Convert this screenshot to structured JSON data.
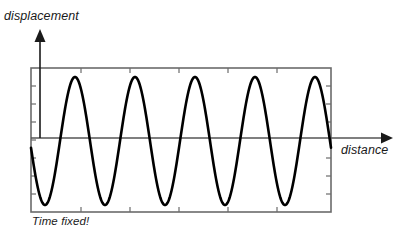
{
  "figure": {
    "title": "",
    "labels": {
      "y_axis": "displacement",
      "x_axis": "distance",
      "annotation": "Time fixed!"
    },
    "colors": {
      "curve": "#000000",
      "axis": "#555555",
      "frame": "#6b6b6b",
      "background": "#ffffff",
      "text": "#1a1a1a"
    }
  },
  "chart_data": {
    "type": "line",
    "title": "",
    "xlabel": "distance",
    "ylabel": "displacement",
    "annotations": [
      "Time fixed!"
    ],
    "grid": false,
    "legend": null,
    "waveform": {
      "function": "cosine",
      "expression": "y = -A*cos(2*pi*(x - x0)/wavelength)",
      "amplitude": 1.0,
      "wavelength": 60,
      "cycles": 5,
      "phase_description": "starts slightly below zero and descends to a trough",
      "start_value": -0.25,
      "end_value": 0.0
    },
    "axes": {
      "zero_line_y": 138,
      "plot_box": {
        "left": 31,
        "top": 68,
        "right": 331,
        "bottom": 212
      },
      "x_axis_arrow_end": 387,
      "y_axis_arrow_top": 30,
      "xlim_pixels": [
        31,
        331
      ],
      "ylim_normalized": [
        -1,
        1
      ]
    },
    "peaks": {
      "x": [
        75,
        135,
        195,
        255,
        315
      ],
      "y": [
        1,
        1,
        1,
        1,
        1
      ]
    },
    "troughs": {
      "x": [
        46,
        106,
        166,
        226,
        286
      ],
      "y": [
        -1,
        -1,
        -1,
        -1,
        -1
      ]
    },
    "ticks": {
      "left_edge_count": 8,
      "bottom_edge_count": 6,
      "right_edge_count": 8,
      "top_edge_count": 6,
      "tick_labels": []
    }
  }
}
